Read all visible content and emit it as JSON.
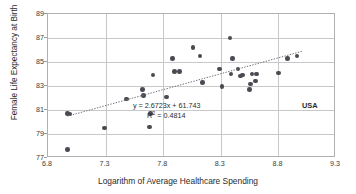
{
  "chart_data": {
    "type": "scatter",
    "title": "",
    "xlabel": "Logarithm of Average Healthcare Spending",
    "ylabel": "Female Life Expectancy at Birth",
    "xlim": [
      6.8,
      9.3
    ],
    "ylim": [
      77,
      89
    ],
    "xticks": [
      "6.8",
      "7.3",
      "7.8",
      "8.3",
      "8.8",
      "9.3"
    ],
    "xtick_values": [
      6.8,
      7.3,
      7.8,
      8.3,
      8.8,
      9.3
    ],
    "yticks": [
      "77",
      "79",
      "81",
      "83",
      "85",
      "87",
      "89"
    ],
    "ytick_values": [
      77,
      79,
      81,
      83,
      85,
      87,
      89
    ],
    "grid": "both",
    "legend": "none",
    "marker_color": "#4a4a52",
    "trendline_color": "#6e6e76",
    "points": [
      {
        "x": 6.97,
        "y": 77.7
      },
      {
        "x": 6.97,
        "y": 80.7
      },
      {
        "x": 6.99,
        "y": 80.65
      },
      {
        "x": 7.29,
        "y": 79.5
      },
      {
        "x": 7.48,
        "y": 81.9
      },
      {
        "x": 7.62,
        "y": 82.7
      },
      {
        "x": 7.63,
        "y": 82.2
      },
      {
        "x": 7.68,
        "y": 79.6
      },
      {
        "x": 7.69,
        "y": 80.7
      },
      {
        "x": 7.71,
        "y": 83.9
      },
      {
        "x": 7.83,
        "y": 82.1
      },
      {
        "x": 7.88,
        "y": 85.3
      },
      {
        "x": 7.9,
        "y": 84.2
      },
      {
        "x": 7.94,
        "y": 84.2
      },
      {
        "x": 8.06,
        "y": 86.2
      },
      {
        "x": 8.12,
        "y": 85.5
      },
      {
        "x": 8.14,
        "y": 83.3
      },
      {
        "x": 8.29,
        "y": 84.4
      },
      {
        "x": 8.31,
        "y": 82.95
      },
      {
        "x": 8.38,
        "y": 87.0
      },
      {
        "x": 8.39,
        "y": 84.0
      },
      {
        "x": 8.4,
        "y": 85.3
      },
      {
        "x": 8.45,
        "y": 84.4
      },
      {
        "x": 8.47,
        "y": 83.85
      },
      {
        "x": 8.49,
        "y": 83.9
      },
      {
        "x": 8.55,
        "y": 82.7
      },
      {
        "x": 8.56,
        "y": 83.15
      },
      {
        "x": 8.57,
        "y": 84.0
      },
      {
        "x": 8.6,
        "y": 83.4
      },
      {
        "x": 8.61,
        "y": 84.0
      },
      {
        "x": 8.8,
        "y": 84.1
      },
      {
        "x": 8.88,
        "y": 85.3
      },
      {
        "x": 8.96,
        "y": 85.5
      }
    ],
    "trendline": {
      "slope": 2.6723,
      "intercept": 61.743,
      "x_start": 6.97,
      "x_end": 9.02,
      "style": "dotted"
    },
    "annotations": {
      "equation": "y = 2.6723x + 61.743",
      "r_squared_prefix": "R",
      "r_squared_exponent": "2",
      "r_squared_value": " = 0.4814",
      "country_label": "USA"
    }
  }
}
